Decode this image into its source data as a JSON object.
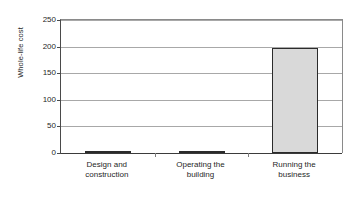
{
  "chart_data": {
    "type": "bar",
    "title": "",
    "subtitle": "",
    "xlabel": "",
    "ylabel": "Whole-life cost",
    "categories": [
      "Design and construction",
      "Operating the building",
      "Running the business"
    ],
    "category_lines": [
      [
        "Design and",
        "construction"
      ],
      [
        "Operating the",
        "building"
      ],
      [
        "Running the",
        "business"
      ]
    ],
    "values": [
      1,
      4,
      198
    ],
    "ylim": [
      0,
      250
    ],
    "yticks": [
      0,
      50,
      100,
      150,
      200,
      250
    ],
    "ytick_labels": [
      "0",
      "50",
      "100",
      "150",
      "200",
      "250"
    ],
    "grid": "horizontal",
    "legend": "none",
    "annotations": [],
    "colors": {
      "bar_fill": "#d9d9d9",
      "bar_border": "#2b2b2b",
      "gridline": "#a8a8a8",
      "axis": "#3b3b3b",
      "text": "#1f1f1f",
      "background": "#ffffff"
    }
  }
}
